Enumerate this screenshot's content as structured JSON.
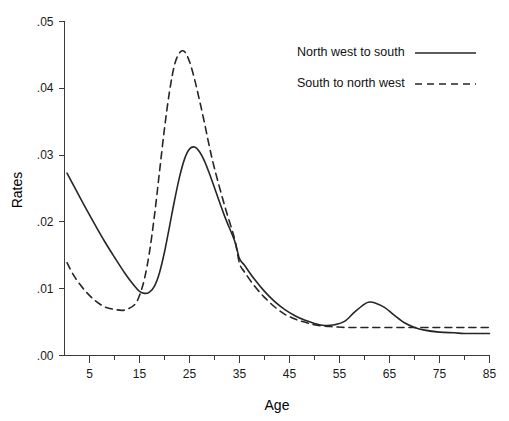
{
  "chart_data": {
    "type": "line",
    "title": "",
    "xlabel": "Age",
    "ylabel": "Rates",
    "xlim": [
      0,
      85
    ],
    "ylim": [
      0.0,
      0.05
    ],
    "grid": false,
    "legend_position": "top-right",
    "x_ticks": [
      5,
      15,
      25,
      35,
      45,
      55,
      65,
      75,
      85
    ],
    "x_tick_labels": [
      "5",
      "15",
      "25",
      "35",
      "45",
      "55",
      "65",
      "75",
      "85"
    ],
    "x_minor_ticks": [
      10,
      20,
      30,
      40,
      50,
      60,
      70,
      80
    ],
    "y_ticks": [
      0.0,
      0.01,
      0.02,
      0.03,
      0.04,
      0.05
    ],
    "y_tick_labels": [
      ".00",
      ".01",
      ".02",
      ".03",
      ".04",
      ".05"
    ],
    "x_axis_start": 0.5,
    "series": [
      {
        "name": "North west to south",
        "style": "solid",
        "color": "#262626",
        "x": [
          0.5,
          2,
          4,
          6,
          8,
          10,
          12,
          14,
          15,
          16,
          17,
          18,
          19,
          20,
          21,
          22,
          23,
          24,
          25,
          26,
          27,
          28,
          29,
          30,
          32,
          34,
          35,
          36,
          38,
          40,
          42,
          44,
          46,
          48,
          50,
          52,
          54,
          56,
          58,
          60,
          61,
          62,
          64,
          66,
          68,
          70,
          72,
          75,
          78,
          80,
          85
        ],
        "values": [
          0.0273,
          0.0252,
          0.0224,
          0.0197,
          0.0171,
          0.0147,
          0.0124,
          0.0104,
          0.0096,
          0.0093,
          0.0095,
          0.0104,
          0.0124,
          0.0155,
          0.0193,
          0.0232,
          0.0267,
          0.0294,
          0.0309,
          0.0312,
          0.0305,
          0.0291,
          0.0272,
          0.0251,
          0.0209,
          0.0172,
          0.0145,
          0.0135,
          0.0114,
          0.0096,
          0.0081,
          0.0069,
          0.006,
          0.0053,
          0.0048,
          0.0045,
          0.0046,
          0.0051,
          0.0065,
          0.0077,
          0.008,
          0.0079,
          0.0072,
          0.006,
          0.0049,
          0.0042,
          0.0038,
          0.0035,
          0.0034,
          0.0033,
          0.0033
        ]
      },
      {
        "name": "South to north west",
        "style": "dashed",
        "color": "#262626",
        "x": [
          0.5,
          2,
          4,
          6,
          8,
          10,
          12,
          14,
          15,
          16,
          17,
          18,
          19,
          20,
          21,
          22,
          23,
          24,
          25,
          26,
          27,
          28,
          29,
          30,
          32,
          34,
          35,
          36,
          38,
          40,
          42,
          44,
          46,
          48,
          50,
          52,
          54,
          56,
          58,
          60,
          62,
          65,
          68,
          70,
          73,
          76,
          80,
          85
        ],
        "values": [
          0.0139,
          0.0118,
          0.0098,
          0.0083,
          0.0073,
          0.0069,
          0.0068,
          0.0076,
          0.009,
          0.0115,
          0.0155,
          0.021,
          0.0275,
          0.034,
          0.0395,
          0.0435,
          0.0453,
          0.0455,
          0.044,
          0.0414,
          0.0382,
          0.0348,
          0.0312,
          0.028,
          0.0225,
          0.0175,
          0.0138,
          0.0125,
          0.0104,
          0.0087,
          0.0073,
          0.0062,
          0.0055,
          0.005,
          0.0046,
          0.0044,
          0.0043,
          0.0042,
          0.0042,
          0.0042,
          0.0042,
          0.0042,
          0.0042,
          0.0042,
          0.0042,
          0.0042,
          0.0042,
          0.0042
        ]
      }
    ],
    "legend": [
      {
        "label": "North west to south",
        "style": "solid"
      },
      {
        "label": "South to north west",
        "style": "dashed"
      }
    ]
  }
}
